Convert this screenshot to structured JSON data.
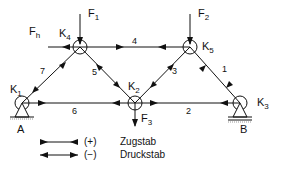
{
  "diagram": {
    "type": "truss",
    "nodes": [
      {
        "id": "K1",
        "label": "K",
        "sub": "1"
      },
      {
        "id": "K2",
        "label": "K",
        "sub": "2"
      },
      {
        "id": "K3",
        "label": "K",
        "sub": "3"
      },
      {
        "id": "K4",
        "label": "K",
        "sub": "4"
      },
      {
        "id": "K5",
        "label": "K",
        "sub": "5"
      }
    ],
    "members": [
      "1",
      "2",
      "3",
      "4",
      "5",
      "6",
      "7"
    ],
    "forces": [
      {
        "id": "F1",
        "label": "F",
        "sub": "1"
      },
      {
        "id": "F2",
        "label": "F",
        "sub": "2"
      },
      {
        "id": "F3",
        "label": "F",
        "sub": "3"
      },
      {
        "id": "Fh",
        "label": "F",
        "sub": "h"
      }
    ],
    "supports": [
      "A",
      "B"
    ]
  },
  "legend": {
    "tension": {
      "sign": "(+)",
      "label": "Zugstab"
    },
    "compression": {
      "sign": "(−)",
      "label": "Druckstab"
    }
  },
  "colors": {
    "line": "#111111",
    "background": "#ffffff"
  }
}
